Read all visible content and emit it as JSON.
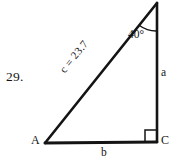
{
  "figure": {
    "problem_number": "29.",
    "type": "right-triangle-diagram",
    "stroke_color": "#141414",
    "background_color": "#ffffff",
    "vertices": [
      {
        "name": "A",
        "label": "A",
        "x": 45,
        "y": 143
      },
      {
        "name": "B",
        "label": "",
        "x": 157,
        "y": 3
      },
      {
        "name": "C",
        "label": "C",
        "x": 157,
        "y": 142
      }
    ],
    "sides": [
      {
        "name": "a",
        "label": "a",
        "position": "right"
      },
      {
        "name": "b",
        "label": "b",
        "position": "bottom"
      },
      {
        "name": "c",
        "label": "c = 23.7",
        "position": "hypotenuse"
      }
    ],
    "angles": [
      {
        "at": "B",
        "label": "40°",
        "value": 40,
        "marker": "arc"
      },
      {
        "at": "C",
        "label": "",
        "value": 90,
        "marker": "square"
      }
    ]
  }
}
